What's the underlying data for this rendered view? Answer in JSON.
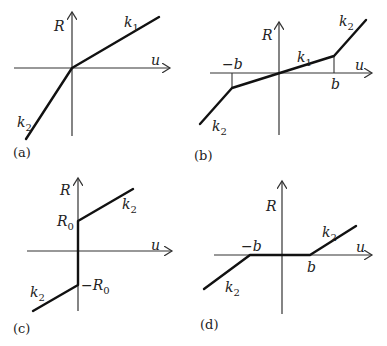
{
  "panels": [
    {
      "id": "a",
      "caption": "(a)",
      "y_axis_label": "R",
      "x_axis_label": "u",
      "segments": [
        {
          "label": "k",
          "sub": "1",
          "desc": "positive slope k1 for u>0"
        },
        {
          "label": "k",
          "sub": "2",
          "desc": "steeper slope k2 for u<0"
        }
      ]
    },
    {
      "id": "b",
      "caption": "(b)",
      "y_axis_label": "R",
      "x_axis_label": "u",
      "ticks": {
        "neg": "−b",
        "pos": "b"
      },
      "segments": [
        {
          "label": "k",
          "sub": "1",
          "desc": "slope k1 for |u|<b"
        },
        {
          "label": "k",
          "sub": "2",
          "desc": "slope k2 for u>b"
        },
        {
          "label": "k",
          "sub": "2",
          "desc": "slope k2 for u<-b"
        }
      ]
    },
    {
      "id": "c",
      "caption": "(c)",
      "y_axis_label": "R",
      "x_axis_label": "u",
      "ticks": {
        "pos": "R",
        "pos_sub": "0",
        "neg": "−R",
        "neg_sub": "0"
      },
      "segments": [
        {
          "label": "k",
          "sub": "2",
          "desc": "slope k2 from R0 for u>0"
        },
        {
          "label": "k",
          "sub": "2",
          "desc": "slope k2 to -R0 for u<0"
        }
      ]
    },
    {
      "id": "d",
      "caption": "(d)",
      "y_axis_label": "R",
      "x_axis_label": "u",
      "ticks": {
        "neg": "−b",
        "pos": "b"
      },
      "segments": [
        {
          "label": "k",
          "sub": "2",
          "desc": "slope k2 for u>b"
        },
        {
          "label": "k",
          "sub": "2",
          "desc": "slope k2 for u<-b"
        }
      ]
    }
  ]
}
